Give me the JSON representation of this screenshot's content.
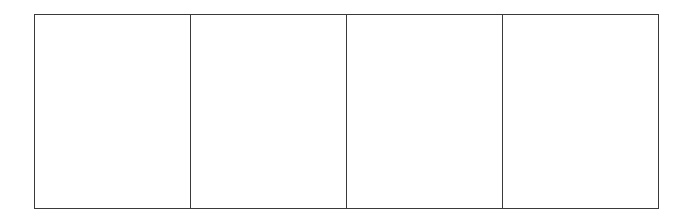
{
  "grid": {
    "rows": 1,
    "columns": 4,
    "border_color": "#3a3a3a",
    "background_color": "#ffffff",
    "cells": [
      {
        "label": ""
      },
      {
        "label": ""
      },
      {
        "label": ""
      },
      {
        "label": ""
      }
    ]
  }
}
